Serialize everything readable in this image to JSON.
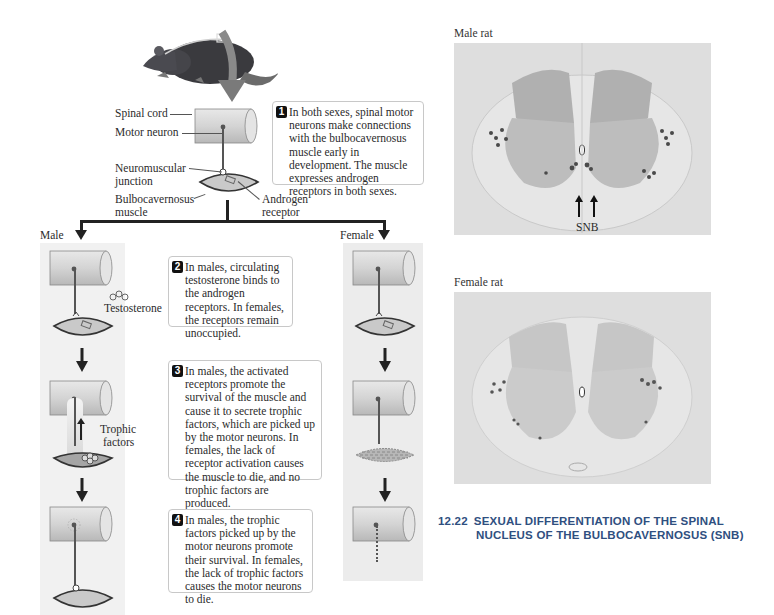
{
  "figure": {
    "number": "12.22",
    "caption_line1": "SEXUAL DIFFERENTIATION OF THE SPINAL",
    "caption_line2": "NUCLEUS OF THE BULBOCAVERNOSUS (SNB)"
  },
  "diagram": {
    "labels": {
      "spinal_cord": "Spinal cord",
      "motor_neuron": "Motor neuron",
      "nmj_line1": "Neuromuscular",
      "nmj_line2": "junction",
      "bulbo_line1": "Bulbocavernosus",
      "bulbo_line2": "muscle",
      "androgen_line1": "Androgen",
      "androgen_line2": "receptor",
      "male": "Male",
      "female": "Female",
      "testosterone": "Testosterone",
      "trophic_line1": "Trophic",
      "trophic_line2": "factors"
    },
    "steps": [
      {
        "num": "1",
        "text": "In both sexes, spinal motor neurons make connections with the bulbocavernosus muscle early in development. The muscle expresses androgen receptors in both sexes."
      },
      {
        "num": "2",
        "text": "In males, circulating testosterone binds to the androgen receptors. In females, the receptors remain unoccupied."
      },
      {
        "num": "3",
        "text": "In males, the activated receptors promote the survival of the muscle and cause it to secrete trophic factors, which are picked up by the motor neurons. In females, the lack of receptor activation causes the muscle to die, and no trophic factors are produced."
      },
      {
        "num": "4",
        "text": "In males, the trophic factors picked up by the motor neurons promote their survival. In females, the lack of trophic factors causes the motor neurons to die."
      }
    ]
  },
  "micrographs": {
    "male_title": "Male rat",
    "female_title": "Female rat",
    "snb_label": "SNB"
  }
}
